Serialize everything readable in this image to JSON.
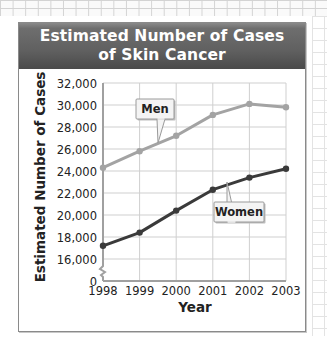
{
  "header": {
    "title_line1": "Estimated Number of Cases",
    "title_line2": "of Skin Cancer"
  },
  "axes": {
    "ylabel": "Estimated Number of Cases",
    "xlabel": "Year",
    "y_ticks": [
      "32,000",
      "30,000",
      "28,000",
      "26,000",
      "24,000",
      "22,000",
      "20,000",
      "18,000",
      "16,000",
      "0"
    ],
    "x_ticks": [
      "1998",
      "1999",
      "2000",
      "2001",
      "2002",
      "2003"
    ]
  },
  "labels": {
    "men": "Men",
    "women": "Women"
  },
  "colors": {
    "men_line": "#a3a3a3",
    "women_line": "#3a3a3a",
    "grid": "#cfcfcf",
    "header": "#5e5e5e"
  },
  "chart_data": {
    "type": "line",
    "title": "Estimated Number of Cases of Skin Cancer",
    "xlabel": "Year",
    "ylabel": "Estimated Number of Cases",
    "categories": [
      "1998",
      "1999",
      "2000",
      "2001",
      "2002",
      "2003"
    ],
    "series": [
      {
        "name": "Men",
        "values": [
          24300,
          25800,
          27200,
          29100,
          30100,
          29800
        ]
      },
      {
        "name": "Women",
        "values": [
          17200,
          18400,
          20400,
          22300,
          23400,
          24200
        ]
      }
    ],
    "ylim": [
      16000,
      32000
    ],
    "y_axis_break": "0 to 16,000 (broken axis)",
    "y_tick_step": 2000,
    "grid": true,
    "legend": "callout labels on lines"
  }
}
